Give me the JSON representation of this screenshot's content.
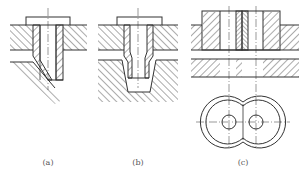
{
  "figure": {
    "panels": [
      {
        "id": "a",
        "label": "(a)",
        "description": "Flanged sleeve through plate with slanted lower part"
      },
      {
        "id": "b",
        "label": "(b)",
        "description": "Flanged stepped sleeve through plate with trapezoidal recess"
      },
      {
        "id": "c",
        "label": "(c)",
        "description": "Double sleeve in raised block, section and top view with two circles"
      }
    ],
    "colors": {
      "line": "#333333",
      "background": "#ffffff",
      "label": "#555555"
    }
  }
}
